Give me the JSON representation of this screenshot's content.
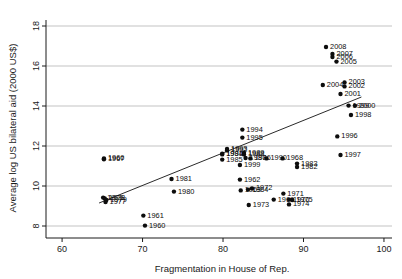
{
  "chart_data": {
    "type": "scatter",
    "title": "",
    "xlabel": "Fragmentation in House of Rep.",
    "ylabel": "Average log US bilateral aid (2000 US$)",
    "xlim": [
      58,
      101
    ],
    "ylim": [
      7.4,
      18.3
    ],
    "xticks": [
      60,
      70,
      80,
      90,
      100
    ],
    "yticks": [
      8,
      10,
      12,
      14,
      16,
      18
    ],
    "grid": "horizontal",
    "legend": "none",
    "point_label_field": "year",
    "trendline": {
      "visible": true,
      "x": [
        64.6,
        97.2
      ],
      "y": [
        9.15,
        14.45
      ]
    },
    "points": [
      {
        "label": "2008",
        "x": 92.8,
        "y": 16.95
      },
      {
        "label": "2007",
        "x": 93.6,
        "y": 16.6
      },
      {
        "label": "2006",
        "x": 93.6,
        "y": 16.45
      },
      {
        "label": "2005",
        "x": 94.1,
        "y": 16.22
      },
      {
        "label": "2004",
        "x": 92.4,
        "y": 15.05
      },
      {
        "label": "2003",
        "x": 95.1,
        "y": 15.18
      },
      {
        "label": "2002",
        "x": 95.1,
        "y": 14.98
      },
      {
        "label": "2001",
        "x": 94.6,
        "y": 14.6
      },
      {
        "label": "1999",
        "x": 95.6,
        "y": 14.02
      },
      {
        "label": "2000",
        "x": 96.4,
        "y": 14.02
      },
      {
        "label": "1998",
        "x": 95.9,
        "y": 13.55
      },
      {
        "label": "1996",
        "x": 94.2,
        "y": 12.48
      },
      {
        "label": "1997",
        "x": 94.6,
        "y": 11.55
      },
      {
        "label": "1994",
        "x": 82.4,
        "y": 12.82
      },
      {
        "label": "1995",
        "x": 82.4,
        "y": 12.42
      },
      {
        "label": "1993",
        "x": 80.5,
        "y": 11.85
      },
      {
        "label": "1992",
        "x": 80.5,
        "y": 11.78
      },
      {
        "label": "1991",
        "x": 79.9,
        "y": 11.62
      },
      {
        "label": "1984",
        "x": 79.9,
        "y": 11.58
      },
      {
        "label": "1985",
        "x": 79.9,
        "y": 11.32
      },
      {
        "label": "1966",
        "x": 65.2,
        "y": 11.38
      },
      {
        "label": "1967",
        "x": 65.2,
        "y": 11.34
      },
      {
        "label": "1989",
        "x": 82.6,
        "y": 11.66
      },
      {
        "label": "1988",
        "x": 82.6,
        "y": 11.58
      },
      {
        "label": "1987",
        "x": 82.8,
        "y": 11.4
      },
      {
        "label": "1986",
        "x": 83.4,
        "y": 11.38
      },
      {
        "label": "1990",
        "x": 85.4,
        "y": 11.38
      },
      {
        "label": "1968",
        "x": 87.4,
        "y": 11.38
      },
      {
        "label": "1983",
        "x": 89.2,
        "y": 11.12
      },
      {
        "label": "1982",
        "x": 89.2,
        "y": 10.95
      },
      {
        "label": "1999b",
        "x": 82.1,
        "y": 11.05
      },
      {
        "label": "1981",
        "x": 73.6,
        "y": 10.35
      },
      {
        "label": "1962",
        "x": 82.1,
        "y": 10.32
      },
      {
        "label": "1980",
        "x": 73.9,
        "y": 9.72
      },
      {
        "label": "1963",
        "x": 82.2,
        "y": 9.78
      },
      {
        "label": "1964",
        "x": 83.1,
        "y": 9.82
      },
      {
        "label": "1972",
        "x": 83.6,
        "y": 9.88
      },
      {
        "label": "1971",
        "x": 87.5,
        "y": 9.62
      },
      {
        "label": "1969",
        "x": 86.3,
        "y": 9.32
      },
      {
        "label": "1970",
        "x": 88.2,
        "y": 9.32
      },
      {
        "label": "1975",
        "x": 88.6,
        "y": 9.3
      },
      {
        "label": "1974",
        "x": 88.2,
        "y": 9.08
      },
      {
        "label": "1973",
        "x": 83.2,
        "y": 9.05
      },
      {
        "label": "1976",
        "x": 65.1,
        "y": 9.42
      },
      {
        "label": "1978",
        "x": 65.3,
        "y": 9.38
      },
      {
        "label": "1979",
        "x": 65.5,
        "y": 9.3
      },
      {
        "label": "1977",
        "x": 65.4,
        "y": 9.2
      },
      {
        "label": "1961",
        "x": 70.1,
        "y": 8.52
      },
      {
        "label": "1960",
        "x": 70.3,
        "y": 8.02
      }
    ]
  }
}
